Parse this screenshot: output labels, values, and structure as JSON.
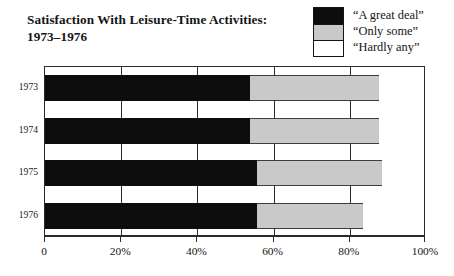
{
  "title": {
    "line1": "Satisfaction With Leisure-Time Activities:",
    "line2": "1973–1976"
  },
  "legend": {
    "items": [
      {
        "label": "“A great deal”",
        "swatch": "black",
        "color": "#0d0d0d"
      },
      {
        "label": "“Only some”",
        "swatch": "gray",
        "color": "#c9c9c9"
      },
      {
        "label": "“Hardly any”",
        "swatch": "white",
        "color": "#ffffff"
      }
    ]
  },
  "axis": {
    "x_tick_labels": [
      "0",
      "20%",
      "40%",
      "60%",
      "80%",
      "100%"
    ],
    "x_tick_values": [
      0,
      20,
      40,
      60,
      80,
      100
    ]
  },
  "chart_data": {
    "type": "bar",
    "orientation": "horizontal",
    "stacked": true,
    "stack_total": 100,
    "title": "Satisfaction With Leisure-Time Activities: 1973–1976",
    "xlabel": "",
    "ylabel": "",
    "xlim": [
      0,
      100
    ],
    "xticks": [
      0,
      20,
      40,
      60,
      80,
      100
    ],
    "xticklabels": [
      "0",
      "20%",
      "40%",
      "60%",
      "80%",
      "100%"
    ],
    "grid": true,
    "grid_axis": "x",
    "legend_position": "top-right",
    "categories": [
      "1973",
      "1974",
      "1975",
      "1976"
    ],
    "series": [
      {
        "name": "“A great deal”",
        "color": "#0d0d0d",
        "values": [
          54,
          54,
          56,
          56
        ]
      },
      {
        "name": "“Only some”",
        "color": "#c9c9c9",
        "values": [
          34,
          34,
          33,
          28
        ]
      },
      {
        "name": "“Hardly any”",
        "color": "#ffffff",
        "values": [
          12,
          12,
          11,
          16
        ]
      }
    ]
  }
}
